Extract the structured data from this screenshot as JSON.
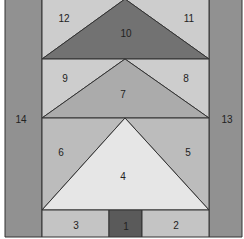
{
  "diagram": {
    "pieces": [
      {
        "id": "1",
        "label": "1",
        "shape": "rectangle",
        "color": "#5a5a5a"
      },
      {
        "id": "2",
        "label": "2",
        "shape": "rectangle",
        "color": "#c4c4c4"
      },
      {
        "id": "3",
        "label": "3",
        "shape": "rectangle",
        "color": "#c4c4c4"
      },
      {
        "id": "4",
        "label": "4",
        "shape": "triangle",
        "color": "#e6e6e6"
      },
      {
        "id": "5",
        "label": "5",
        "shape": "triangle",
        "color": "#bcbcbc"
      },
      {
        "id": "6",
        "label": "6",
        "shape": "triangle",
        "color": "#bcbcbc"
      },
      {
        "id": "7",
        "label": "7",
        "shape": "triangle",
        "color": "#ababab"
      },
      {
        "id": "8",
        "label": "8",
        "shape": "triangle",
        "color": "#cdcdcd"
      },
      {
        "id": "9",
        "label": "9",
        "shape": "triangle",
        "color": "#cdcdcd"
      },
      {
        "id": "10",
        "label": "10",
        "shape": "triangle",
        "color": "#727272"
      },
      {
        "id": "11",
        "label": "11",
        "shape": "triangle",
        "color": "#cdcdcd"
      },
      {
        "id": "12",
        "label": "12",
        "shape": "triangle",
        "color": "#cdcdcd"
      },
      {
        "id": "13",
        "label": "13",
        "shape": "rectangle",
        "color": "#919191"
      },
      {
        "id": "14",
        "label": "14",
        "shape": "rectangle",
        "color": "#919191"
      }
    ]
  }
}
